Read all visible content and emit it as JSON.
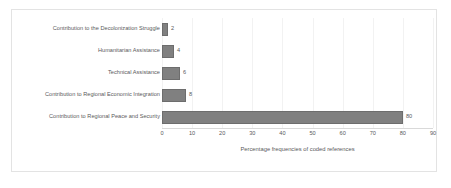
{
  "chart_data": {
    "type": "bar",
    "orientation": "horizontal",
    "title": "",
    "xlabel": "Percentage frequencies of coded references",
    "ylabel": "",
    "xlim": [
      0,
      90
    ],
    "xticks": [
      0,
      10,
      20,
      30,
      40,
      50,
      60,
      70,
      80,
      90
    ],
    "grid": true,
    "legend": false,
    "categories": [
      "Contribution to the Decolonization Struggle",
      "Humanitarian Assistance",
      "Technical Assistance",
      "Contribution to Regional Economic Integration",
      "Contribution to Regional Peace and Security"
    ],
    "values": [
      2,
      4,
      6,
      8,
      80
    ],
    "data_labels": [
      "2",
      "4",
      "6",
      "8",
      "80"
    ],
    "bar_color": "#808080",
    "text_color": "#59595b",
    "frame_color": "#e3e3e3",
    "background": "#ffffff"
  }
}
